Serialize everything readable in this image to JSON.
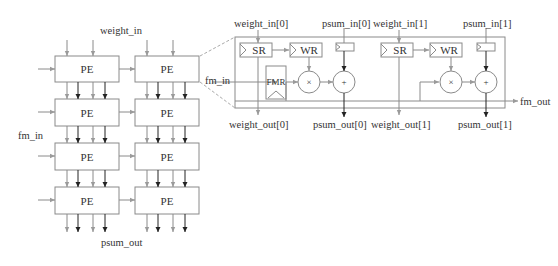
{
  "grid": {
    "weight_in_label": "weight_in",
    "fm_in_label": "fm_in",
    "psum_out_label": "psum_out",
    "pe_label": "PE",
    "rows": 4,
    "cols": 2
  },
  "detail": {
    "fm_in_label": "fm_in",
    "fm_out_label": "fm_out",
    "fmr_label": "FMR",
    "units": [
      {
        "weight_in": "weight_in[0]",
        "psum_in": "psum_in[0]",
        "weight_out": "weight_out[0]",
        "psum_out": "psum_out[0]",
        "sr_label": "SR",
        "wr_label": "WR",
        "mult_symbol": "×",
        "add_symbol": "+"
      },
      {
        "weight_in": "weight_in[1]",
        "psum_in": "psum_in[1]",
        "weight_out": "weight_out[1]",
        "psum_out": "psum_out[1]",
        "sr_label": "SR",
        "wr_label": "WR",
        "mult_symbol": "×",
        "add_symbol": "+"
      }
    ]
  },
  "colors": {
    "line": "#8a8a8a",
    "dark_arrow": "#222222",
    "text": "#333333"
  }
}
